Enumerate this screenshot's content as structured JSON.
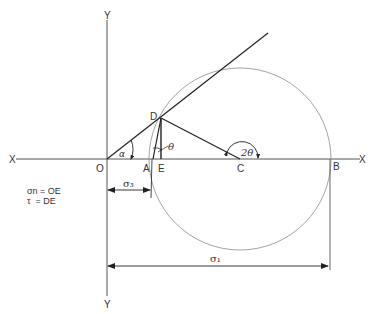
{
  "diagram": {
    "type": "Mohr circle construction",
    "axes": {
      "x_left_label": "X",
      "x_right_label": "X",
      "y_top_label": "Y",
      "y_bottom_label": "Y"
    },
    "points": {
      "O": "O",
      "A": "A",
      "E": "E",
      "C": "C",
      "B": "B",
      "D": "D"
    },
    "angles": {
      "alpha": "α",
      "theta": "θ",
      "two_theta": "2θ"
    },
    "dimensions": {
      "sigma3": "σ₃",
      "sigma1": "σ₁"
    },
    "legend": {
      "line1": "σn = OE",
      "line2": "τ  = DE"
    },
    "colors": {
      "line": "#222222",
      "axis": "#555555",
      "circle": "#888888"
    }
  }
}
